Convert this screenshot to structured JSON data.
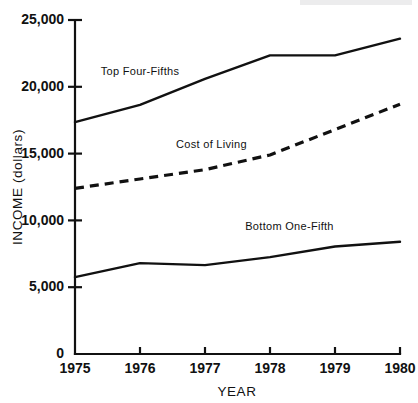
{
  "chart_data": {
    "type": "line",
    "title": "",
    "xlabel": "YEAR",
    "ylabel": "INCOME (dollars)",
    "x": [
      1975,
      1976,
      1977,
      1978,
      1979,
      1980
    ],
    "xtick_labels": [
      "1975",
      "1976",
      "1977",
      "1978",
      "1979",
      "1980"
    ],
    "ytick_labels": [
      "0",
      "5,000",
      "10,000",
      "15,000",
      "20,000",
      "25,000"
    ],
    "ytick_values": [
      0,
      5000,
      10000,
      15000,
      20000,
      25000
    ],
    "xlim": [
      1975,
      1980
    ],
    "ylim": [
      0,
      25000
    ],
    "grid": false,
    "legend_position": "inline-annotations",
    "series": [
      {
        "name": "Top Four-Fifths",
        "style": "solid",
        "values": [
          17350,
          18650,
          20600,
          22350,
          22350,
          23600
        ],
        "label_x": 1976.0,
        "label_y": 20900
      },
      {
        "name": "Cost of Living",
        "style": "dashed",
        "values": [
          12400,
          13100,
          13800,
          14900,
          16800,
          18700
        ],
        "label_x": 1977.1,
        "label_y": 15450
      },
      {
        "name": "Bottom One-Fifth",
        "style": "solid",
        "values": [
          5750,
          6800,
          6650,
          7250,
          8050,
          8400
        ],
        "label_x": 1978.3,
        "label_y": 9250
      }
    ]
  },
  "axes": {
    "y_title": "INCOME (dollars)",
    "x_title": "YEAR"
  }
}
